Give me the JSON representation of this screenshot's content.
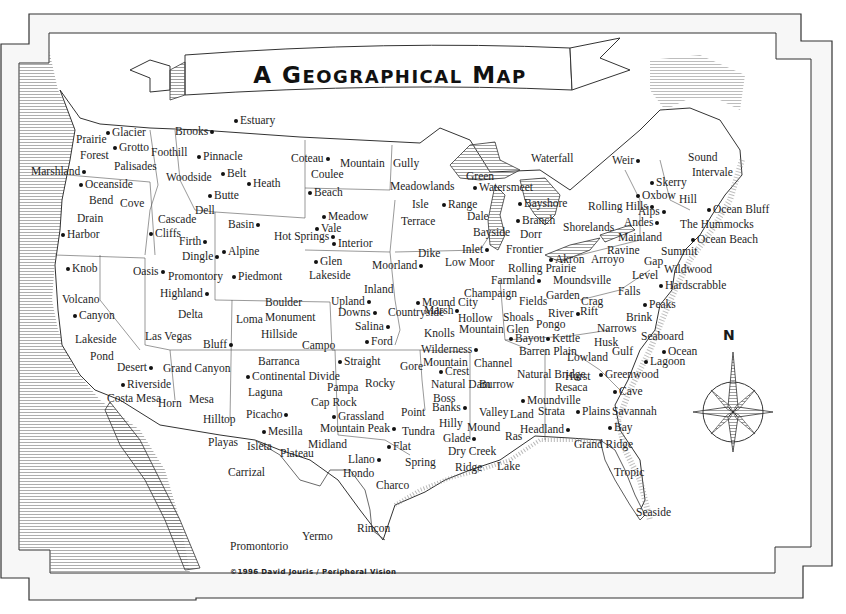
{
  "map": {
    "title": "A Geographical Map",
    "title_parts": {
      "a": "A ",
      "g": "G",
      "eographical": "EOGRAPHICAL",
      "space": " ",
      "m": "M",
      "ap": "AP"
    },
    "credit": "©1996 David Jouris / Peripheral Vision",
    "compass": {
      "label": "N"
    },
    "colors": {
      "ink": "#1a1a1a",
      "paper": "#ffffff",
      "frame": "#333333",
      "hatching": "#666666"
    }
  },
  "places": [
    {
      "name": "Estuary",
      "x": 232,
      "y": 114,
      "dot": "left"
    },
    {
      "name": "Brooks",
      "x": 175,
      "y": 125,
      "dot": "right"
    },
    {
      "name": "Glacier",
      "x": 104,
      "y": 126,
      "dot": "left"
    },
    {
      "name": "Prairie",
      "x": 76,
      "y": 133,
      "dot": "none"
    },
    {
      "name": "Grotto",
      "x": 111,
      "y": 141,
      "dot": "left"
    },
    {
      "name": "Forest",
      "x": 80,
      "y": 149,
      "dot": "none"
    },
    {
      "name": "Foothill",
      "x": 151,
      "y": 146,
      "dot": "none"
    },
    {
      "name": "Pinnacle",
      "x": 195,
      "y": 150,
      "dot": "left"
    },
    {
      "name": "Palisades",
      "x": 114,
      "y": 160,
      "dot": "none"
    },
    {
      "name": "Marshland",
      "x": 31,
      "y": 165,
      "dot": "right"
    },
    {
      "name": "Oceanside",
      "x": 77,
      "y": 178,
      "dot": "left"
    },
    {
      "name": "Woodside",
      "x": 166,
      "y": 171,
      "dot": "none"
    },
    {
      "name": "Belt",
      "x": 219,
      "y": 167,
      "dot": "left"
    },
    {
      "name": "Heath",
      "x": 245,
      "y": 177,
      "dot": "left"
    },
    {
      "name": "Butte",
      "x": 206,
      "y": 189,
      "dot": "left"
    },
    {
      "name": "Bend",
      "x": 89,
      "y": 194,
      "dot": "none"
    },
    {
      "name": "Cove",
      "x": 120,
      "y": 197,
      "dot": "none"
    },
    {
      "name": "Dell",
      "x": 195,
      "y": 204,
      "dot": "none"
    },
    {
      "name": "Drain",
      "x": 77,
      "y": 212,
      "dot": "none"
    },
    {
      "name": "Cascade",
      "x": 158,
      "y": 213,
      "dot": "none"
    },
    {
      "name": "Basin",
      "x": 228,
      "y": 218,
      "dot": "right"
    },
    {
      "name": "Harbor",
      "x": 59,
      "y": 228,
      "dot": "left"
    },
    {
      "name": "Cliffs",
      "x": 147,
      "y": 227,
      "dot": "left"
    },
    {
      "name": "Firth",
      "x": 179,
      "y": 235,
      "dot": "right"
    },
    {
      "name": "Hot Springs",
      "x": 274,
      "y": 230,
      "dot": "right"
    },
    {
      "name": "Alpine",
      "x": 220,
      "y": 245,
      "dot": "left"
    },
    {
      "name": "Dingle",
      "x": 182,
      "y": 250,
      "dot": "right"
    },
    {
      "name": "Knob",
      "x": 64,
      "y": 262,
      "dot": "left"
    },
    {
      "name": "Oasis",
      "x": 133,
      "y": 265,
      "dot": "right"
    },
    {
      "name": "Promontory",
      "x": 168,
      "y": 270,
      "dot": "none"
    },
    {
      "name": "Piedmont",
      "x": 230,
      "y": 270,
      "dot": "left"
    },
    {
      "name": "Highland",
      "x": 160,
      "y": 287,
      "dot": "right"
    },
    {
      "name": "Volcano",
      "x": 62,
      "y": 293,
      "dot": "none"
    },
    {
      "name": "Canyon",
      "x": 71,
      "y": 309,
      "dot": "left"
    },
    {
      "name": "Delta",
      "x": 178,
      "y": 308,
      "dot": "none"
    },
    {
      "name": "Loma",
      "x": 236,
      "y": 313,
      "dot": "none"
    },
    {
      "name": "Lakeside",
      "x": 75,
      "y": 333,
      "dot": "none"
    },
    {
      "name": "Las Vegas",
      "x": 145,
      "y": 330,
      "dot": "none"
    },
    {
      "name": "Bluff",
      "x": 203,
      "y": 338,
      "dot": "right"
    },
    {
      "name": "Pond",
      "x": 90,
      "y": 350,
      "dot": "none"
    },
    {
      "name": "Desert",
      "x": 117,
      "y": 361,
      "dot": "right"
    },
    {
      "name": "Grand Canyon",
      "x": 163,
      "y": 362,
      "dot": "none"
    },
    {
      "name": "Riverside",
      "x": 119,
      "y": 378,
      "dot": "left"
    },
    {
      "name": "Costa Mesa",
      "x": 107,
      "y": 392,
      "dot": "none"
    },
    {
      "name": "Horn",
      "x": 158,
      "y": 397,
      "dot": "none"
    },
    {
      "name": "Mesa",
      "x": 189,
      "y": 393,
      "dot": "none"
    },
    {
      "name": "Hilltop",
      "x": 203,
      "y": 413,
      "dot": "none"
    },
    {
      "name": "Picacho",
      "x": 246,
      "y": 408,
      "dot": "right"
    },
    {
      "name": "Coteau",
      "x": 291,
      "y": 152,
      "dot": "right"
    },
    {
      "name": "Mountain",
      "x": 340,
      "y": 157,
      "dot": "none"
    },
    {
      "name": "Coulee",
      "x": 311,
      "y": 168,
      "dot": "none"
    },
    {
      "name": "Beach",
      "x": 306,
      "y": 186,
      "dot": "left"
    },
    {
      "name": "Meadow",
      "x": 320,
      "y": 210,
      "dot": "left"
    },
    {
      "name": "Vale",
      "x": 313,
      "y": 222,
      "dot": "left"
    },
    {
      "name": "Interior",
      "x": 330,
      "y": 237,
      "dot": "left"
    },
    {
      "name": "Glen",
      "x": 312,
      "y": 255,
      "dot": "left"
    },
    {
      "name": "Lakeside",
      "x": 309,
      "y": 269,
      "dot": "none"
    },
    {
      "name": "Moorland",
      "x": 372,
      "y": 259,
      "dot": "right"
    },
    {
      "name": "Dike",
      "x": 418,
      "y": 247,
      "dot": "none"
    },
    {
      "name": "Low Moor",
      "x": 445,
      "y": 256,
      "dot": "none"
    },
    {
      "name": "Gully",
      "x": 393,
      "y": 157,
      "dot": "none"
    },
    {
      "name": "Meadowlands",
      "x": 390,
      "y": 180,
      "dot": "none"
    },
    {
      "name": "Isle",
      "x": 412,
      "y": 198,
      "dot": "none"
    },
    {
      "name": "Range",
      "x": 440,
      "y": 198,
      "dot": "left"
    },
    {
      "name": "Terrace",
      "x": 401,
      "y": 215,
      "dot": "none"
    },
    {
      "name": "Inland",
      "x": 364,
      "y": 283,
      "dot": "none"
    },
    {
      "name": "Upland",
      "x": 331,
      "y": 295,
      "dot": "right"
    },
    {
      "name": "Marsh",
      "x": 424,
      "y": 304,
      "dot": "right"
    },
    {
      "name": "Mound City",
      "x": 414,
      "y": 296,
      "dot": "left"
    },
    {
      "name": "Boulder",
      "x": 265,
      "y": 296,
      "dot": "none"
    },
    {
      "name": "Monument",
      "x": 265,
      "y": 311,
      "dot": "none"
    },
    {
      "name": "Hillside",
      "x": 261,
      "y": 328,
      "dot": "none"
    },
    {
      "name": "Downs",
      "x": 338,
      "y": 306,
      "dot": "right"
    },
    {
      "name": "Countryside",
      "x": 388,
      "y": 306,
      "dot": "none"
    },
    {
      "name": "Salina",
      "x": 355,
      "y": 320,
      "dot": "right"
    },
    {
      "name": "Campo",
      "x": 302,
      "y": 339,
      "dot": "none"
    },
    {
      "name": "Ford",
      "x": 363,
      "y": 335,
      "dot": "left"
    },
    {
      "name": "Hollow",
      "x": 458,
      "y": 312,
      "dot": "none"
    },
    {
      "name": "Knolls",
      "x": 424,
      "y": 327,
      "dot": "none"
    },
    {
      "name": "Mountain Glen",
      "x": 459,
      "y": 323,
      "dot": "none"
    },
    {
      "name": "Wilderness",
      "x": 421,
      "y": 343,
      "dot": "right"
    },
    {
      "name": "Barranca",
      "x": 258,
      "y": 355,
      "dot": "none"
    },
    {
      "name": "Straight",
      "x": 336,
      "y": 355,
      "dot": "left"
    },
    {
      "name": "Continental Divide",
      "x": 244,
      "y": 370,
      "dot": "left"
    },
    {
      "name": "Gore",
      "x": 400,
      "y": 360,
      "dot": "none"
    },
    {
      "name": "Mountain",
      "x": 423,
      "y": 356,
      "dot": "none"
    },
    {
      "name": "Crest",
      "x": 437,
      "y": 365,
      "dot": "left"
    },
    {
      "name": "Channel",
      "x": 474,
      "y": 357,
      "dot": "none"
    },
    {
      "name": "Laguna",
      "x": 248,
      "y": 386,
      "dot": "none"
    },
    {
      "name": "Pampa",
      "x": 327,
      "y": 381,
      "dot": "none"
    },
    {
      "name": "Rocky",
      "x": 365,
      "y": 377,
      "dot": "none"
    },
    {
      "name": "Natural Dam",
      "x": 431,
      "y": 378,
      "dot": "none"
    },
    {
      "name": "Burrow",
      "x": 479,
      "y": 378,
      "dot": "none"
    },
    {
      "name": "Cap Rock",
      "x": 311,
      "y": 396,
      "dot": "none"
    },
    {
      "name": "Boss",
      "x": 433,
      "y": 392,
      "dot": "none"
    },
    {
      "name": "Banks",
      "x": 432,
      "y": 401,
      "dot": "right"
    },
    {
      "name": "Point",
      "x": 401,
      "y": 406,
      "dot": "none"
    },
    {
      "name": "Valley",
      "x": 479,
      "y": 406,
      "dot": "none"
    },
    {
      "name": "Grassland",
      "x": 330,
      "y": 410,
      "dot": "left"
    },
    {
      "name": "Mountain Peak",
      "x": 320,
      "y": 422,
      "dot": "right"
    },
    {
      "name": "Tundra",
      "x": 402,
      "y": 425,
      "dot": "none"
    },
    {
      "name": "Hilly",
      "x": 439,
      "y": 417,
      "dot": "none"
    },
    {
      "name": "Mound",
      "x": 467,
      "y": 421,
      "dot": "none"
    },
    {
      "name": "Glade",
      "x": 443,
      "y": 432,
      "dot": "right"
    },
    {
      "name": "Mesilla",
      "x": 260,
      "y": 425,
      "dot": "left"
    },
    {
      "name": "Playas",
      "x": 208,
      "y": 436,
      "dot": "none"
    },
    {
      "name": "Isleta",
      "x": 247,
      "y": 440,
      "dot": "none"
    },
    {
      "name": "Plateau",
      "x": 280,
      "y": 447,
      "dot": "none"
    },
    {
      "name": "Midland",
      "x": 308,
      "y": 438,
      "dot": "none"
    },
    {
      "name": "Flat",
      "x": 385,
      "y": 440,
      "dot": "left"
    },
    {
      "name": "Llano",
      "x": 348,
      "y": 453,
      "dot": "right"
    },
    {
      "name": "Dry Creek",
      "x": 448,
      "y": 445,
      "dot": "none"
    },
    {
      "name": "Spring",
      "x": 405,
      "y": 456,
      "dot": "none"
    },
    {
      "name": "Carrizal",
      "x": 228,
      "y": 466,
      "dot": "none"
    },
    {
      "name": "Hondo",
      "x": 343,
      "y": 467,
      "dot": "none"
    },
    {
      "name": "Ridge",
      "x": 455,
      "y": 461,
      "dot": "none"
    },
    {
      "name": "Lake",
      "x": 497,
      "y": 460,
      "dot": "none"
    },
    {
      "name": "Charco",
      "x": 376,
      "y": 479,
      "dot": "none"
    },
    {
      "name": "Rincon",
      "x": 357,
      "y": 522,
      "dot": "none"
    },
    {
      "name": "Yermo",
      "x": 302,
      "y": 530,
      "dot": "none"
    },
    {
      "name": "Promontorio",
      "x": 230,
      "y": 540,
      "dot": "none"
    },
    {
      "name": "Waterfall",
      "x": 531,
      "y": 152,
      "dot": "none"
    },
    {
      "name": "Weir",
      "x": 612,
      "y": 154,
      "dot": "right"
    },
    {
      "name": "Green",
      "x": 466,
      "y": 170,
      "dot": "none"
    },
    {
      "name": "Watersmeet",
      "x": 471,
      "y": 181,
      "dot": "left"
    },
    {
      "name": "Bayshore",
      "x": 516,
      "y": 197,
      "dot": "left"
    },
    {
      "name": "Dale",
      "x": 467,
      "y": 210,
      "dot": "none"
    },
    {
      "name": "Branch",
      "x": 514,
      "y": 214,
      "dot": "left"
    },
    {
      "name": "Bayside",
      "x": 473,
      "y": 226,
      "dot": "none"
    },
    {
      "name": "Dorr",
      "x": 520,
      "y": 228,
      "dot": "none"
    },
    {
      "name": "Inlet",
      "x": 462,
      "y": 243,
      "dot": "right"
    },
    {
      "name": "Frontier",
      "x": 506,
      "y": 243,
      "dot": "none"
    },
    {
      "name": "Akron",
      "x": 547,
      "y": 253,
      "dot": "left"
    },
    {
      "name": "Rolling Prairie",
      "x": 508,
      "y": 262,
      "dot": "none"
    },
    {
      "name": "Farmland",
      "x": 491,
      "y": 274,
      "dot": "right"
    },
    {
      "name": "Champaign",
      "x": 464,
      "y": 287,
      "dot": "none"
    },
    {
      "name": "Fields",
      "x": 519,
      "y": 295,
      "dot": "none"
    },
    {
      "name": "Shoals",
      "x": 503,
      "y": 311,
      "dot": "none"
    },
    {
      "name": "Bayou",
      "x": 507,
      "y": 332,
      "dot": "left"
    },
    {
      "name": "Kettle",
      "x": 544,
      "y": 332,
      "dot": "left"
    },
    {
      "name": "Barren Plain",
      "x": 519,
      "y": 345,
      "dot": "none"
    },
    {
      "name": "Natural Bridge",
      "x": 517,
      "y": 368,
      "dot": "none"
    },
    {
      "name": "Moundville",
      "x": 519,
      "y": 394,
      "dot": "left"
    },
    {
      "name": "Land",
      "x": 510,
      "y": 408,
      "dot": "none"
    },
    {
      "name": "Strata",
      "x": 538,
      "y": 405,
      "dot": "none"
    },
    {
      "name": "Headland",
      "x": 520,
      "y": 423,
      "dot": "right"
    },
    {
      "name": "Ras",
      "x": 505,
      "y": 430,
      "dot": "none"
    },
    {
      "name": "Rolling Hills",
      "x": 588,
      "y": 200,
      "dot": "right"
    },
    {
      "name": "Shorelands",
      "x": 563,
      "y": 221,
      "dot": "none"
    },
    {
      "name": "Skerry",
      "x": 648,
      "y": 176,
      "dot": "left"
    },
    {
      "name": "Oxbow",
      "x": 634,
      "y": 189,
      "dot": "left"
    },
    {
      "name": "Alps",
      "x": 638,
      "y": 205,
      "dot": "right"
    },
    {
      "name": "Andes",
      "x": 624,
      "y": 216,
      "dot": "right"
    },
    {
      "name": "Mainland",
      "x": 618,
      "y": 231,
      "dot": "none"
    },
    {
      "name": "Ravine",
      "x": 607,
      "y": 244,
      "dot": "none"
    },
    {
      "name": "Arroyo",
      "x": 591,
      "y": 253,
      "dot": "none"
    },
    {
      "name": "Moundsville",
      "x": 553,
      "y": 274,
      "dot": "none"
    },
    {
      "name": "Garden",
      "x": 546,
      "y": 289,
      "dot": "none"
    },
    {
      "name": "Crag",
      "x": 581,
      "y": 295,
      "dot": "none"
    },
    {
      "name": "Falls",
      "x": 618,
      "y": 285,
      "dot": "none"
    },
    {
      "name": "River",
      "x": 548,
      "y": 307,
      "dot": "right"
    },
    {
      "name": "Rift",
      "x": 580,
      "y": 305,
      "dot": "none"
    },
    {
      "name": "Pongo",
      "x": 536,
      "y": 318,
      "dot": "none"
    },
    {
      "name": "Narrows",
      "x": 597,
      "y": 322,
      "dot": "none"
    },
    {
      "name": "Husk",
      "x": 594,
      "y": 336,
      "dot": "none"
    },
    {
      "name": "Lowland",
      "x": 567,
      "y": 351,
      "dot": "none"
    },
    {
      "name": "Hurst",
      "x": 565,
      "y": 370,
      "dot": "none"
    },
    {
      "name": "Resaca",
      "x": 555,
      "y": 381,
      "dot": "none"
    },
    {
      "name": "Plains",
      "x": 574,
      "y": 405,
      "dot": "left"
    },
    {
      "name": "Bay",
      "x": 606,
      "y": 421,
      "dot": "left"
    },
    {
      "name": "Grand Ridge",
      "x": 574,
      "y": 438,
      "dot": "none"
    },
    {
      "name": "Sound",
      "x": 688,
      "y": 151,
      "dot": "none"
    },
    {
      "name": "Intervale",
      "x": 692,
      "y": 166,
      "dot": "none"
    },
    {
      "name": "Hill",
      "x": 679,
      "y": 193,
      "dot": "none"
    },
    {
      "name": "Ocean Bluff",
      "x": 705,
      "y": 203,
      "dot": "left"
    },
    {
      "name": "The Hummocks",
      "x": 680,
      "y": 218,
      "dot": "none"
    },
    {
      "name": "Ocean Beach",
      "x": 689,
      "y": 233,
      "dot": "left"
    },
    {
      "name": "Summit",
      "x": 661,
      "y": 245,
      "dot": "none"
    },
    {
      "name": "Gap",
      "x": 644,
      "y": 255,
      "dot": "none"
    },
    {
      "name": "Wildwood",
      "x": 664,
      "y": 263,
      "dot": "none"
    },
    {
      "name": "Level",
      "x": 632,
      "y": 269,
      "dot": "none"
    },
    {
      "name": "Hardscrabble",
      "x": 657,
      "y": 279,
      "dot": "left"
    },
    {
      "name": "Peaks",
      "x": 641,
      "y": 298,
      "dot": "left"
    },
    {
      "name": "Brink",
      "x": 626,
      "y": 311,
      "dot": "none"
    },
    {
      "name": "Seaboard",
      "x": 641,
      "y": 330,
      "dot": "none"
    },
    {
      "name": "Gulf",
      "x": 612,
      "y": 345,
      "dot": "none"
    },
    {
      "name": "Ocean",
      "x": 660,
      "y": 345,
      "dot": "left"
    },
    {
      "name": "Lagoon",
      "x": 642,
      "y": 355,
      "dot": "left"
    },
    {
      "name": "Greenwood",
      "x": 597,
      "y": 368,
      "dot": "left"
    },
    {
      "name": "Cave",
      "x": 611,
      "y": 385,
      "dot": "left"
    },
    {
      "name": "Savannah",
      "x": 612,
      "y": 405,
      "dot": "none"
    },
    {
      "name": "Tropic",
      "x": 614,
      "y": 466,
      "dot": "none"
    },
    {
      "name": "Seaside",
      "x": 636,
      "y": 506,
      "dot": "none"
    }
  ]
}
